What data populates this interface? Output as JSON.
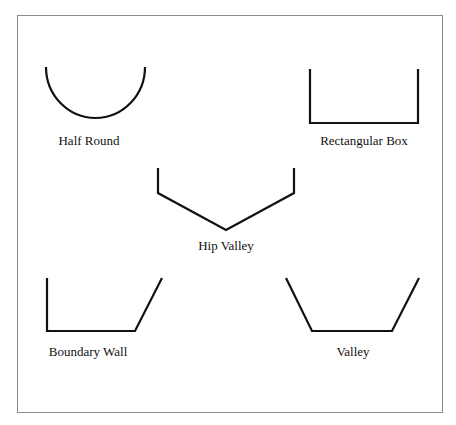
{
  "diagram": {
    "frame": {
      "x": 17,
      "y": 15,
      "width": 426,
      "height": 398,
      "stroke": "#888888"
    },
    "stroke_color": "#111111",
    "shapes": [
      {
        "id": "half-round",
        "label": "Half Round",
        "label_x": 89,
        "label_y": 145
      },
      {
        "id": "rectangular-box",
        "label": "Rectangular Box",
        "label_x": 364,
        "label_y": 145
      },
      {
        "id": "hip-valley",
        "label": "Hip Valley",
        "label_x": 226,
        "label_y": 250
      },
      {
        "id": "boundary-wall",
        "label": "Boundary Wall",
        "label_x": 88,
        "label_y": 356
      },
      {
        "id": "valley",
        "label": "Valley",
        "label_x": 353,
        "label_y": 356
      }
    ]
  }
}
